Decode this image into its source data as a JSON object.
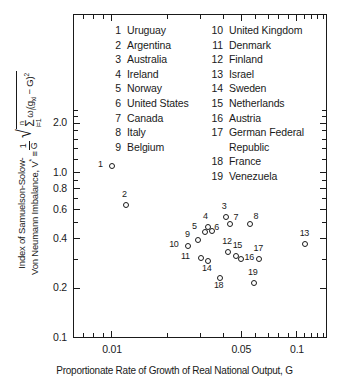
{
  "chart_data": {
    "type": "scatter",
    "title": "",
    "xlabel": "Proportionate Rate of Growth of Real National Output, G",
    "ylabel": "Index of Samuelson-Solow-Von Neumann Imbalance, V*",
    "xscale": "log",
    "yscale": "log",
    "xlim": [
      0.006,
      0.16
    ],
    "ylim": [
      0.1,
      2.6
    ],
    "xticklabels": [
      "0.01",
      "0.05",
      "0.1"
    ],
    "xtickvalues": [
      0.01,
      0.05,
      0.1
    ],
    "yticklabels": [
      "2.0",
      "1.0",
      "0.8",
      "0.6",
      "0.4",
      "0.2",
      "0.1"
    ],
    "ytickvalues": [
      2.0,
      1.0,
      0.8,
      0.6,
      0.4,
      0.2,
      0.1
    ],
    "grid": false,
    "legend_position": "inside-top",
    "points": [
      {
        "id": 1,
        "label": "Uruguay",
        "x": 0.01,
        "y": 1.1,
        "lx": -10,
        "ly": -2
      },
      {
        "id": 2,
        "label": "Argentina",
        "x": 0.0119,
        "y": 0.64,
        "lx": 0,
        "ly": -11
      },
      {
        "id": 3,
        "label": "Australia",
        "x": 0.0412,
        "y": 0.54,
        "lx": 0,
        "ly": -11
      },
      {
        "id": 4,
        "label": "Ireland",
        "x": 0.033,
        "y": 0.47,
        "lx": -1,
        "ly": -11
      },
      {
        "id": 5,
        "label": "Norway",
        "x": 0.0318,
        "y": 0.44,
        "lx": -9,
        "ly": -6
      },
      {
        "id": 6,
        "label": "United States",
        "x": 0.0348,
        "y": 0.445,
        "lx": 6,
        "ly": -4
      },
      {
        "id": 7,
        "label": "Canada",
        "x": 0.0437,
        "y": 0.49,
        "lx": 7,
        "ly": -7
      },
      {
        "id": 8,
        "label": "Italy",
        "x": 0.056,
        "y": 0.49,
        "lx": 7,
        "ly": -8
      },
      {
        "id": 9,
        "label": "Belgium",
        "x": 0.0292,
        "y": 0.395,
        "lx": -9,
        "ly": -6
      },
      {
        "id": 10,
        "label": "United Kingdom",
        "x": 0.0258,
        "y": 0.36,
        "lx": -15,
        "ly": -2
      },
      {
        "id": 11,
        "label": "Denmark",
        "x": 0.0303,
        "y": 0.305,
        "lx": -16,
        "ly": -2
      },
      {
        "id": 12,
        "label": "Finland",
        "x": 0.0425,
        "y": 0.33,
        "lx": -2,
        "ly": -11
      },
      {
        "id": 13,
        "label": "Israel",
        "x": 0.11,
        "y": 0.37,
        "lx": -1,
        "ly": -11
      },
      {
        "id": 14,
        "label": "Sweden",
        "x": 0.033,
        "y": 0.292,
        "lx": -2,
        "ly": 7
      },
      {
        "id": 15,
        "label": "Netherlands",
        "x": 0.0466,
        "y": 0.315,
        "lx": 1,
        "ly": -11
      },
      {
        "id": 16,
        "label": "Austria",
        "x": 0.0495,
        "y": 0.3,
        "lx": 8,
        "ly": -2
      },
      {
        "id": 17,
        "label": "German Federal Republic",
        "x": 0.062,
        "y": 0.3,
        "lx": -1,
        "ly": -11
      },
      {
        "id": 18,
        "label": "France",
        "x": 0.0383,
        "y": 0.232,
        "lx": -2,
        "ly": 7
      },
      {
        "id": 19,
        "label": "Venezuela",
        "x": 0.0585,
        "y": 0.215,
        "lx": -2,
        "ly": -11
      }
    ]
  },
  "axes": {
    "x_title": "Proportionate Rate of Growth of Real National Output, G",
    "y_title_part1": "Index of Samuelson-Solow-",
    "y_title_part2": "Von Neumann Imbalance, V",
    "y_title_star": "*",
    "y_title_equiv": "≡",
    "frac_num": "1",
    "frac_den": "G",
    "sigma_top": "n",
    "sigma_char": "Σ",
    "sigma_bottom": "i=1",
    "radical_body": "ω",
    "radical_sub": "i",
    "radical_rest": "(g",
    "radical_sub2": "xi",
    "radical_rest2": " − G)",
    "radical_sup": "2"
  },
  "legend": {
    "column1": [
      {
        "num": "1",
        "name": "Uruguay"
      },
      {
        "num": "2",
        "name": "Argentina"
      },
      {
        "num": "3",
        "name": "Australia"
      },
      {
        "num": "4",
        "name": "Ireland"
      },
      {
        "num": "5",
        "name": "Norway"
      },
      {
        "num": "6",
        "name": "United States"
      },
      {
        "num": "7",
        "name": "Canada"
      },
      {
        "num": "8",
        "name": "Italy"
      },
      {
        "num": "9",
        "name": "Belgium"
      }
    ],
    "column2": [
      {
        "num": "10",
        "name": "United Kingdom"
      },
      {
        "num": "11",
        "name": "Denmark"
      },
      {
        "num": "12",
        "name": "Finland"
      },
      {
        "num": "13",
        "name": "Israel"
      },
      {
        "num": "14",
        "name": "Sweden"
      },
      {
        "num": "15",
        "name": "Netherlands"
      },
      {
        "num": "16",
        "name": "Austria"
      },
      {
        "num": "17",
        "name": "German Federal"
      },
      {
        "num": "",
        "name": "Republic"
      },
      {
        "num": "18",
        "name": "France"
      },
      {
        "num": "19",
        "name": "Venezuela"
      }
    ]
  },
  "colors": {
    "ink": "#1a1a1a",
    "background": "#ffffff"
  }
}
